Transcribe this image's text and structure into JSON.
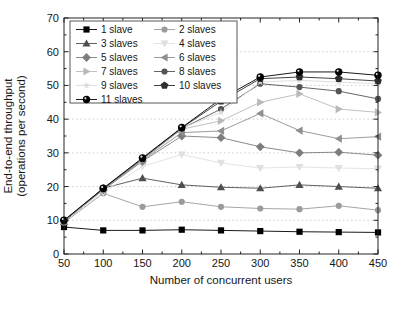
{
  "figure": {
    "background": "#ffffff"
  },
  "chart_data": {
    "type": "line",
    "title": "",
    "xlabel": "Number of concurrent users",
    "ylabel": [
      "End-to-end throughput",
      "(operations per second)"
    ],
    "xlim": [
      50,
      450
    ],
    "ylim": [
      0,
      70
    ],
    "xticks": [
      50,
      100,
      150,
      200,
      250,
      300,
      350,
      400,
      450
    ],
    "yticks": [
      0,
      10,
      20,
      30,
      40,
      50,
      60,
      70
    ],
    "x_minor_step": 25,
    "y_minor_step": 5,
    "grid": "horizontal-dotted",
    "grid_color": "#bfbfbf",
    "axis_color": "#222222",
    "legend_position": "top-left",
    "legend_columns": 2,
    "x": [
      50,
      100,
      150,
      200,
      250,
      300,
      350,
      400,
      450
    ],
    "series": [
      {
        "name": "1 slave",
        "marker": "square",
        "color": "#000000",
        "values": [
          8.0,
          7.0,
          7.0,
          7.2,
          7.0,
          6.8,
          6.6,
          6.5,
          6.4
        ]
      },
      {
        "name": "2 slaves",
        "marker": "circle",
        "color": "#9b9b9b",
        "values": [
          9.3,
          18.0,
          14.0,
          15.5,
          14.0,
          13.5,
          13.3,
          14.3,
          13.0
        ]
      },
      {
        "name": "3 slaves",
        "marker": "triangle-up",
        "color": "#4f4f4f",
        "values": [
          9.5,
          19.5,
          22.5,
          20.5,
          19.8,
          19.5,
          20.5,
          20.0,
          19.5
        ]
      },
      {
        "name": "4 slaves",
        "marker": "triangle-down",
        "color": "#e0e0e0",
        "values": [
          9.6,
          18.3,
          26.0,
          29.5,
          27.0,
          25.5,
          25.8,
          25.5,
          25.3
        ]
      },
      {
        "name": "5 slaves",
        "marker": "diamond",
        "color": "#7d7d7d",
        "values": [
          9.7,
          19.0,
          27.5,
          35.0,
          34.5,
          31.8,
          30.0,
          30.2,
          29.3
        ]
      },
      {
        "name": "6 slaves",
        "marker": "triangle-left",
        "color": "#8f8f8f",
        "values": [
          9.7,
          19.2,
          27.8,
          36.0,
          36.5,
          41.7,
          36.6,
          34.2,
          34.8
        ]
      },
      {
        "name": "7 slaves",
        "marker": "triangle-right",
        "color": "#b9b9b9",
        "values": [
          9.8,
          19.3,
          28.0,
          37.0,
          39.5,
          45.0,
          47.5,
          43.0,
          42.0
        ]
      },
      {
        "name": "8 slaves",
        "marker": "circle",
        "color": "#545454",
        "values": [
          9.8,
          19.3,
          28.1,
          37.2,
          43.0,
          50.5,
          49.5,
          48.3,
          46.0
        ]
      },
      {
        "name": "9 slaves",
        "marker": "star",
        "color": "#dadada",
        "values": [
          9.8,
          19.4,
          28.2,
          37.3,
          42.0,
          51.0,
          51.5,
          51.0,
          50.5
        ]
      },
      {
        "name": "10 slaves",
        "marker": "pentagon",
        "color": "#2e2e2e",
        "values": [
          9.9,
          19.4,
          28.3,
          37.4,
          45.3,
          52.0,
          52.5,
          52.0,
          51.3
        ]
      },
      {
        "name": "11 slaves",
        "marker": "sphere",
        "color": "#000000",
        "values": [
          10.0,
          19.5,
          28.5,
          37.5,
          46.0,
          52.5,
          54.0,
          54.0,
          53.0
        ]
      }
    ],
    "legend_order": [
      "1 slave",
      "2 slaves",
      "3 slaves",
      "4 slaves",
      "5 slaves",
      "6 slaves",
      "7 slaves",
      "8 slaves",
      "9 slaves",
      "10 slaves",
      "11 slaves"
    ]
  }
}
